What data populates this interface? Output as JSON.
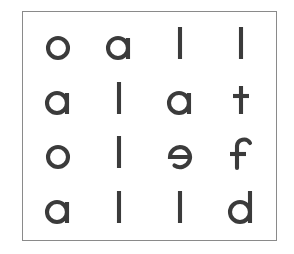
{
  "figure": {
    "type": "letter-grid",
    "rows": 4,
    "columns": 4,
    "border_color": "#8a8a8a",
    "text_color": "#3b3b3b",
    "background_color": "#ffffff",
    "grid": [
      [
        "o",
        "a",
        "l",
        "l"
      ],
      [
        "a",
        "l",
        "a",
        "t"
      ],
      [
        "o",
        "l",
        "e",
        "f"
      ],
      [
        "a",
        "l",
        "l",
        "d"
      ]
    ],
    "row_strings": [
      "oall",
      "alat",
      "olef",
      "alld"
    ],
    "column_strings": [
      "oaoa",
      "alll",
      "lael",
      "ltfd"
    ],
    "letters_used": [
      "a",
      "d",
      "e",
      "f",
      "l",
      "o",
      "t"
    ]
  }
}
